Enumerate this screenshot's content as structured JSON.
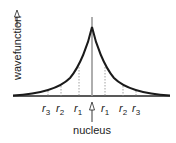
{
  "diagram": {
    "y_axis_label": "wavefunction",
    "x_marker_label": "nucleus",
    "radius_labels_left": [
      {
        "base": "r",
        "sub": "3"
      },
      {
        "base": "r",
        "sub": "2"
      },
      {
        "base": "r",
        "sub": "1"
      }
    ],
    "radius_labels_right": [
      {
        "base": "r",
        "sub": "1"
      },
      {
        "base": "r",
        "sub": "2"
      },
      {
        "base": "r",
        "sub": "3"
      }
    ],
    "curve_color": "#1a1a1a",
    "center_line_color": "#9a9a9a",
    "dotted_line_color": "#8a8a8a"
  }
}
